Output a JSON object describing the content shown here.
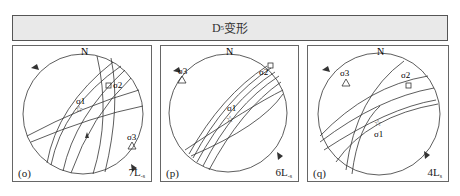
{
  "header": {
    "title_main": "D",
    "title_sub": "5",
    "title_suffix": "变形"
  },
  "panels": [
    {
      "id": "o",
      "label": "(o)",
      "count_main": "7L",
      "count_sub": "-s",
      "north": "N",
      "sigma1": "σ1",
      "sigma2": "σ2",
      "sigma3": "σ3",
      "sigma1_symbol": "star",
      "sigma2_symbol": "square",
      "sigma3_symbol": "triangle"
    },
    {
      "id": "p",
      "label": "(p)",
      "count_main": "6L",
      "count_sub": "-s",
      "north": "N",
      "sigma1": "σ1",
      "sigma2": "σ2",
      "sigma3": "σ3",
      "sigma1_symbol": "star",
      "sigma2_symbol": "square",
      "sigma3_symbol": "triangle"
    },
    {
      "id": "q",
      "label": "(q)",
      "count_main": "4L",
      "count_sub": "s",
      "north": "N",
      "sigma1": "σ1",
      "sigma2": "σ2",
      "sigma3": "σ3",
      "sigma1_symbol": "star",
      "sigma2_symbol": "square",
      "sigma3_symbol": "triangle"
    }
  ],
  "colors": {
    "line": "#333333",
    "frame": "#666666",
    "header_bg": "#e9e9e9"
  }
}
